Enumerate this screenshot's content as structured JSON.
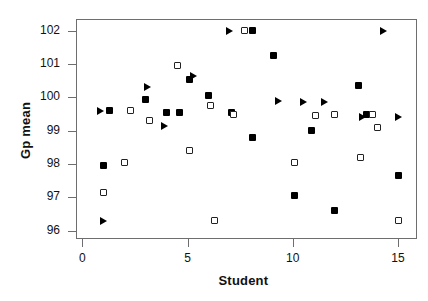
{
  "chart_data": {
    "type": "scatter",
    "title": "",
    "xlabel": "Student",
    "ylabel": "Gp mean",
    "xlim": [
      -0.3,
      15.9
    ],
    "ylim": [
      95.75,
      102.35
    ],
    "grid": false,
    "legend": "none",
    "xticks": [
      0,
      5,
      10,
      15
    ],
    "xtick_labels": [
      "0",
      "5",
      "10",
      "15"
    ],
    "yticks": [
      96,
      97,
      98,
      99,
      100,
      101,
      102
    ],
    "ytick_labels": [
      "96",
      "97",
      "98",
      "99",
      "100",
      "101",
      "102"
    ],
    "series": [
      {
        "name": "filled-square",
        "marker": "filled-square",
        "color": "#000000",
        "points": [
          {
            "x": 1.0,
            "y": 97.95
          },
          {
            "x": 1.3,
            "y": 99.6
          },
          {
            "x": 3.0,
            "y": 99.95
          },
          {
            "x": 4.0,
            "y": 99.55
          },
          {
            "x": 4.6,
            "y": 99.55
          },
          {
            "x": 5.1,
            "y": 100.55
          },
          {
            "x": 6.0,
            "y": 100.05
          },
          {
            "x": 7.1,
            "y": 99.55
          },
          {
            "x": 8.1,
            "y": 102.0
          },
          {
            "x": 8.1,
            "y": 98.8
          },
          {
            "x": 9.1,
            "y": 101.25
          },
          {
            "x": 10.1,
            "y": 97.05
          },
          {
            "x": 10.9,
            "y": 99.0
          },
          {
            "x": 12.0,
            "y": 96.6
          },
          {
            "x": 13.1,
            "y": 100.35
          },
          {
            "x": 13.5,
            "y": 99.5
          },
          {
            "x": 15.0,
            "y": 97.65
          }
        ]
      },
      {
        "name": "open-square",
        "marker": "open-square",
        "color": "#222222",
        "points": [
          {
            "x": 1.0,
            "y": 97.15
          },
          {
            "x": 2.0,
            "y": 98.05
          },
          {
            "x": 2.3,
            "y": 99.6
          },
          {
            "x": 3.2,
            "y": 99.3
          },
          {
            "x": 4.5,
            "y": 100.95
          },
          {
            "x": 5.1,
            "y": 98.4
          },
          {
            "x": 6.1,
            "y": 99.75
          },
          {
            "x": 6.3,
            "y": 96.3
          },
          {
            "x": 7.2,
            "y": 99.5
          },
          {
            "x": 7.7,
            "y": 102.0
          },
          {
            "x": 10.1,
            "y": 98.05
          },
          {
            "x": 11.1,
            "y": 99.45
          },
          {
            "x": 12.0,
            "y": 99.5
          },
          {
            "x": 13.2,
            "y": 98.2
          },
          {
            "x": 13.8,
            "y": 99.5
          },
          {
            "x": 14.0,
            "y": 99.1
          },
          {
            "x": 15.0,
            "y": 96.3
          }
        ]
      },
      {
        "name": "triangle",
        "marker": "right-triangle",
        "color": "#000000",
        "points": [
          {
            "x": 1.0,
            "y": 96.3
          },
          {
            "x": 0.85,
            "y": 99.6
          },
          {
            "x": 3.1,
            "y": 100.3
          },
          {
            "x": 3.9,
            "y": 99.15
          },
          {
            "x": 5.3,
            "y": 100.65
          },
          {
            "x": 7.0,
            "y": 102.0
          },
          {
            "x": 9.3,
            "y": 99.9
          },
          {
            "x": 10.5,
            "y": 99.85
          },
          {
            "x": 11.5,
            "y": 99.85
          },
          {
            "x": 13.3,
            "y": 99.4
          },
          {
            "x": 14.3,
            "y": 102.0
          },
          {
            "x": 15.0,
            "y": 99.4
          }
        ]
      }
    ]
  },
  "axes_geometry": {
    "plot_left_px": 76,
    "plot_top_px": 19,
    "plot_right_px": 417,
    "plot_bottom_px": 239
  }
}
